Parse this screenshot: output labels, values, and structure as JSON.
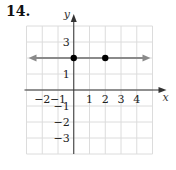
{
  "problem": {
    "number": "14."
  },
  "chart_data": {
    "type": "line",
    "title": "",
    "xlabel": "x",
    "ylabel": "y",
    "xlim": [
      -3,
      5
    ],
    "ylim": [
      -4,
      4
    ],
    "grid": true,
    "x_tick_labels": [
      {
        "value": -2,
        "label": "−2"
      },
      {
        "value": -1,
        "label": "−1"
      },
      {
        "value": 1,
        "label": "1"
      },
      {
        "value": 2,
        "label": "2"
      },
      {
        "value": 3,
        "label": "3"
      },
      {
        "value": 4,
        "label": "4"
      }
    ],
    "y_tick_labels": [
      {
        "value": 3,
        "label": "3"
      },
      {
        "value": 1,
        "label": "1"
      },
      {
        "value": -1,
        "label": "−1"
      },
      {
        "value": -2,
        "label": "−2"
      },
      {
        "value": -3,
        "label": "−3"
      }
    ],
    "series": [
      {
        "name": "y = 2",
        "line": {
          "y": 2,
          "direction": "both-arrows"
        },
        "color": "#888888"
      }
    ],
    "points": [
      {
        "x": 0,
        "y": 2
      },
      {
        "x": 2,
        "y": 2
      }
    ],
    "colors": {
      "grid": "#dcdcdc",
      "axis": "#333333",
      "line": "#8a8a8a",
      "point": "#000000"
    }
  }
}
